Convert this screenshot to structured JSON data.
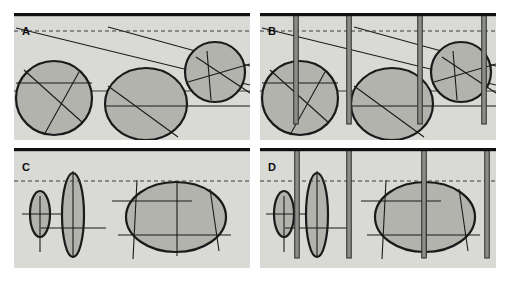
{
  "figure": {
    "width": 509,
    "height": 281,
    "background": "#ffffff",
    "panel_fill": "#d9d9d6",
    "shape_fill": "#b3b3ae",
    "ink": "#1a1a1a",
    "bar_fill": "#8c8c88",
    "bar_edge": "#2b2b2b",
    "caption": ""
  },
  "panels": [
    {
      "id": "A",
      "label": "A",
      "x": 14,
      "y": 13,
      "w": 236,
      "h": 127,
      "label_x": 22,
      "label_y": 26,
      "top_bar": {
        "present": true,
        "thickness": 3.2,
        "color": "#111111"
      },
      "dashed_line": {
        "present": true,
        "y": 31,
        "color": "#3b3b3b",
        "dash": "4,3"
      },
      "horizon_line": {
        "present": true,
        "y": 91,
        "color": "#3b3b3b"
      },
      "vertical_bars": [],
      "shapes": [
        {
          "name": "nodule-a1",
          "type": "circle",
          "cx": 54,
          "cy": 98,
          "rx": 38,
          "ry": 37,
          "chords": [
            {
              "x1": 16,
              "y1": 83,
              "x2": 92,
              "y2": 83
            },
            {
              "x1": 24,
              "y1": 70,
              "x2": 83,
              "y2": 123
            },
            {
              "x1": 79,
              "y1": 72,
              "x2": 44,
              "y2": 135
            }
          ]
        },
        {
          "name": "nodule-a2",
          "type": "ellipse",
          "cx": 146,
          "cy": 104,
          "rx": 41,
          "ry": 36,
          "chords": [
            {
              "x1": 105,
              "y1": 106,
              "x2": 250,
              "y2": 106
            },
            {
              "x1": 108,
              "y1": 86,
              "x2": 178,
              "y2": 137
            }
          ]
        },
        {
          "name": "nodule-a3",
          "type": "circle",
          "cx": 215,
          "cy": 72,
          "rx": 30,
          "ry": 30,
          "chords": [
            {
              "x1": 207,
              "y1": 51,
              "x2": 211,
              "y2": 100
            },
            {
              "x1": 188,
              "y1": 82,
              "x2": 250,
              "y2": 64
            },
            {
              "x1": 196,
              "y1": 57,
              "x2": 250,
              "y2": 93
            }
          ]
        }
      ],
      "long_lines": [
        {
          "name": "bed-line-1",
          "x1": 16,
          "y1": 28,
          "x2": 250,
          "y2": 85
        },
        {
          "name": "bed-line-2",
          "x1": 108,
          "y1": 27,
          "x2": 250,
          "y2": 66
        }
      ]
    },
    {
      "id": "B",
      "label": "B",
      "x": 260,
      "y": 13,
      "w": 236,
      "h": 127,
      "label_x": 268,
      "label_y": 26,
      "top_bar": {
        "present": true,
        "thickness": 3.2,
        "color": "#111111"
      },
      "dashed_line": {
        "present": true,
        "y": 31,
        "color": "#3b3b3b",
        "dash": "4,3"
      },
      "horizon_line": {
        "present": true,
        "y": 91,
        "color": "#3b3b3b"
      },
      "vertical_bars": [
        {
          "name": "burrow-b1",
          "x": 296,
          "top": 14,
          "bottom": 124,
          "width": 4.5
        },
        {
          "name": "burrow-b2",
          "x": 349,
          "top": 14,
          "bottom": 124,
          "width": 4.5
        },
        {
          "name": "burrow-b3",
          "x": 420,
          "top": 14,
          "bottom": 124,
          "width": 4.5
        },
        {
          "name": "burrow-b4",
          "x": 484,
          "top": 14,
          "bottom": 124,
          "width": 4.5
        }
      ],
      "shapes": [
        {
          "name": "nodule-b1",
          "type": "circle",
          "cx": 300,
          "cy": 98,
          "rx": 38,
          "ry": 37,
          "chords": [
            {
              "x1": 262,
              "y1": 83,
              "x2": 338,
              "y2": 83
            },
            {
              "x1": 270,
              "y1": 70,
              "x2": 329,
              "y2": 123
            },
            {
              "x1": 325,
              "y1": 72,
              "x2": 290,
              "y2": 135
            }
          ]
        },
        {
          "name": "nodule-b2",
          "type": "ellipse",
          "cx": 392,
          "cy": 104,
          "rx": 41,
          "ry": 36,
          "chords": [
            {
              "x1": 351,
              "y1": 106,
              "x2": 496,
              "y2": 106
            },
            {
              "x1": 354,
              "y1": 86,
              "x2": 424,
              "y2": 137
            }
          ]
        },
        {
          "name": "nodule-b3",
          "type": "circle",
          "cx": 461,
          "cy": 72,
          "rx": 30,
          "ry": 30,
          "chords": [
            {
              "x1": 453,
              "y1": 51,
              "x2": 457,
              "y2": 100
            },
            {
              "x1": 434,
              "y1": 82,
              "x2": 496,
              "y2": 64
            },
            {
              "x1": 442,
              "y1": 57,
              "x2": 496,
              "y2": 93
            }
          ]
        }
      ],
      "long_lines": [
        {
          "name": "bed-line-1",
          "x1": 262,
          "y1": 28,
          "x2": 496,
          "y2": 85
        },
        {
          "name": "bed-line-2",
          "x1": 354,
          "y1": 27,
          "x2": 496,
          "y2": 66
        }
      ]
    },
    {
      "id": "C",
      "label": "C",
      "x": 14,
      "y": 148,
      "w": 236,
      "h": 120,
      "label_x": 22,
      "label_y": 162,
      "top_bar": {
        "present": true,
        "thickness": 3.2,
        "color": "#111111"
      },
      "dashed_line": {
        "present": true,
        "y": 181,
        "color": "#3b3b3b",
        "dash": "4,3"
      },
      "horizon_line": {
        "present": false,
        "y": 0,
        "color": "#3b3b3b"
      },
      "vertical_bars": [],
      "shapes": [
        {
          "name": "nodule-c1",
          "type": "ellipse",
          "cx": 40,
          "cy": 214,
          "rx": 10,
          "ry": 23,
          "chords": [
            {
              "x1": 22,
              "y1": 214,
              "x2": 76,
              "y2": 214
            },
            {
              "x1": 40,
              "y1": 196,
              "x2": 40,
              "y2": 252
            }
          ]
        },
        {
          "name": "nodule-c2",
          "type": "ellipse",
          "cx": 73,
          "cy": 215,
          "rx": 11,
          "ry": 42,
          "chords": [
            {
              "x1": 41,
              "y1": 228,
              "x2": 106,
              "y2": 228
            },
            {
              "x1": 73,
              "y1": 171,
              "x2": 73,
              "y2": 258
            }
          ]
        },
        {
          "name": "nodule-c3",
          "type": "ellipse",
          "cx": 176,
          "cy": 217,
          "rx": 50,
          "ry": 35,
          "chords": [
            {
              "x1": 112,
              "y1": 201,
              "x2": 192,
              "y2": 201
            },
            {
              "x1": 118,
              "y1": 235,
              "x2": 231,
              "y2": 235
            },
            {
              "x1": 137,
              "y1": 180,
              "x2": 133,
              "y2": 259
            },
            {
              "x1": 177,
              "y1": 181,
              "x2": 177,
              "y2": 256
            },
            {
              "x1": 210,
              "y1": 189,
              "x2": 219,
              "y2": 251
            }
          ]
        }
      ],
      "long_lines": []
    },
    {
      "id": "D",
      "label": "D",
      "x": 260,
      "y": 148,
      "w": 236,
      "h": 120,
      "label_x": 268,
      "label_y": 162,
      "top_bar": {
        "present": true,
        "thickness": 3.2,
        "color": "#111111"
      },
      "dashed_line": {
        "present": true,
        "y": 181,
        "color": "#3b3b3b",
        "dash": "4,3"
      },
      "horizon_line": {
        "present": false,
        "y": 0,
        "color": "#3b3b3b"
      },
      "vertical_bars": [
        {
          "name": "burrow-d1",
          "x": 297,
          "top": 149,
          "bottom": 258,
          "width": 4.5
        },
        {
          "name": "burrow-d2",
          "x": 349,
          "top": 149,
          "bottom": 258,
          "width": 4.5
        },
        {
          "name": "burrow-d3",
          "x": 424,
          "top": 149,
          "bottom": 258,
          "width": 4.5
        },
        {
          "name": "burrow-d4",
          "x": 487,
          "top": 149,
          "bottom": 258,
          "width": 4.5
        }
      ],
      "shapes": [
        {
          "name": "nodule-d1",
          "type": "ellipse",
          "cx": 284,
          "cy": 214,
          "rx": 10,
          "ry": 23,
          "chords": [
            {
              "x1": 266,
              "y1": 214,
              "x2": 320,
              "y2": 214
            },
            {
              "x1": 284,
              "y1": 196,
              "x2": 284,
              "y2": 252
            }
          ]
        },
        {
          "name": "nodule-d2",
          "type": "ellipse",
          "cx": 317,
          "cy": 215,
          "rx": 11,
          "ry": 42,
          "chords": [
            {
              "x1": 285,
              "y1": 228,
              "x2": 350,
              "y2": 228
            },
            {
              "x1": 317,
              "y1": 171,
              "x2": 317,
              "y2": 258
            }
          ]
        },
        {
          "name": "nodule-d3",
          "type": "ellipse",
          "cx": 425,
          "cy": 217,
          "rx": 50,
          "ry": 35,
          "chords": [
            {
              "x1": 361,
              "y1": 201,
              "x2": 441,
              "y2": 201
            },
            {
              "x1": 367,
              "y1": 235,
              "x2": 480,
              "y2": 235
            },
            {
              "x1": 386,
              "y1": 180,
              "x2": 382,
              "y2": 259
            },
            {
              "x1": 426,
              "y1": 181,
              "x2": 426,
              "y2": 256
            },
            {
              "x1": 459,
              "y1": 189,
              "x2": 468,
              "y2": 251
            }
          ]
        }
      ],
      "long_lines": []
    }
  ]
}
